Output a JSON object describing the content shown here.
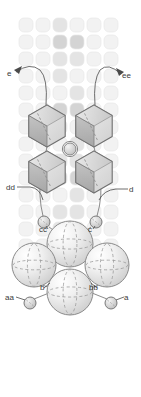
{
  "figure": {
    "name": "crystal-structure-diagram",
    "width": 141,
    "height": 397,
    "background_color": "#ffffff"
  },
  "labels": [
    {
      "id": "e",
      "text": "e",
      "x": 7,
      "y": 76,
      "anchor": "start"
    },
    {
      "id": "ee",
      "text": "ee",
      "x": 122,
      "y": 78,
      "anchor": "start"
    },
    {
      "id": "dd",
      "text": "dd",
      "x": 6,
      "y": 190,
      "anchor": "start"
    },
    {
      "id": "d",
      "text": "d",
      "x": 129,
      "y": 192,
      "anchor": "start"
    },
    {
      "id": "cc",
      "text": "cc",
      "x": 39,
      "y": 232,
      "anchor": "start"
    },
    {
      "id": "c",
      "text": "c",
      "x": 88,
      "y": 232,
      "anchor": "start"
    },
    {
      "id": "b",
      "text": "b",
      "x": 40,
      "y": 290,
      "anchor": "start"
    },
    {
      "id": "bb",
      "text": "bb",
      "x": 89,
      "y": 290,
      "anchor": "start"
    },
    {
      "id": "aa",
      "text": "aa",
      "x": 5,
      "y": 300,
      "anchor": "start"
    },
    {
      "id": "a",
      "text": "a",
      "x": 124,
      "y": 300,
      "anchor": "start"
    }
  ],
  "colors": {
    "lattice_light": "#f2f2f2",
    "lattice_mid": "#e4e4e4",
    "lattice_dark": "#d4d4d4",
    "lattice_stroke": "#e8e8e8",
    "hexagon_fill": "#c9c9c9",
    "hexagon_light": "#e9e9e9",
    "hexagon_stroke": "#6f6f6f",
    "sphere_light": "#fbfbfb",
    "sphere_mid": "#dedede",
    "sphere_stroke": "#8a8a8a",
    "small_sphere_fill": "#d0d0d0",
    "small_sphere_stroke": "#7a7a7a",
    "leader_line": "#555555",
    "label_text": "#3a3a3a"
  },
  "lattice": {
    "name": "background-lattice-grid",
    "columns": 6,
    "rows": 14,
    "cell_size": 17,
    "corner_radius": 5,
    "origin_x": 19,
    "origin_y": 18
  },
  "hexagons": [
    {
      "id": "hex-top-left",
      "cx": 47,
      "cy": 126,
      "r": 21
    },
    {
      "id": "hex-top-right",
      "cx": 94,
      "cy": 126,
      "r": 21
    },
    {
      "id": "hex-bottom-left",
      "cx": 47,
      "cy": 172,
      "r": 21
    },
    {
      "id": "hex-bottom-right",
      "cx": 94,
      "cy": 172,
      "r": 21
    }
  ],
  "spheres": [
    {
      "id": "sphere-center-upper",
      "cx": 70,
      "cy": 244,
      "r": 23
    },
    {
      "id": "sphere-left",
      "cx": 34,
      "cy": 265,
      "r": 22
    },
    {
      "id": "sphere-right",
      "cx": 107,
      "cy": 265,
      "r": 22
    },
    {
      "id": "sphere-center-lower",
      "cx": 70,
      "cy": 292,
      "r": 23
    }
  ],
  "small_spheres": [
    {
      "id": "small-sphere-cc",
      "cx": 44,
      "cy": 222,
      "r": 6
    },
    {
      "id": "small-sphere-c",
      "cx": 96,
      "cy": 222,
      "r": 6
    },
    {
      "id": "small-sphere-aa",
      "cx": 30,
      "cy": 303,
      "r": 6
    },
    {
      "id": "small-sphere-a",
      "cx": 111,
      "cy": 303,
      "r": 6
    },
    {
      "id": "small-sphere-center",
      "cx": 70,
      "cy": 149,
      "r": 6
    }
  ]
}
